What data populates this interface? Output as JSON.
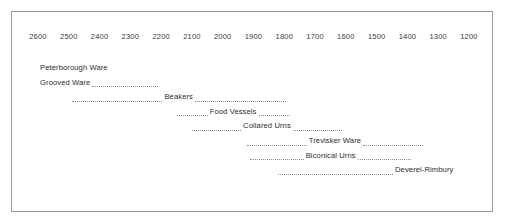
{
  "chart_data": {
    "type": "timeline",
    "title": "",
    "xlabel": "",
    "ylabel": "",
    "grid": false,
    "legend_position": "none",
    "x_axis": {
      "orientation": "horizontal-reversed",
      "unit": "BC",
      "min": 1200,
      "max": 2600,
      "step": 100,
      "tick_labels": [
        "2600",
        "2500",
        "2400",
        "2300",
        "2200",
        "2100",
        "2000",
        "1900",
        "1800",
        "1700",
        "1600",
        "1500",
        "1400",
        "1300",
        "1200"
      ]
    },
    "categories": [
      "Peterborough Ware",
      "Grooved Ware",
      "Beakers",
      "Food Vessels",
      "Collared Urns",
      "Trevisker Ware",
      "Biconical Urns",
      "Deverel-Rimbury"
    ],
    "series": [
      {
        "name": "Peterborough Ware",
        "label": "Peterborough Ware",
        "start": 2600,
        "end": 2480,
        "label_align": "left"
      },
      {
        "name": "Grooved Ware",
        "label": "Grooved Ware",
        "start": 2600,
        "end": 2210,
        "label_align": "left"
      },
      {
        "name": "Beakers",
        "label": "Beakers",
        "start": 2490,
        "end": 1790,
        "label_align": "center"
      },
      {
        "name": "Food Vessels",
        "label": "Food Vessels",
        "start": 2150,
        "end": 1770,
        "label_align": "center"
      },
      {
        "name": "Collared Urns",
        "label": "Collared Urns",
        "start": 2100,
        "end": 1590,
        "label_align": "center"
      },
      {
        "name": "Trevisker Ware",
        "label": "Trevisker Ware",
        "start": 1920,
        "end": 1330,
        "label_align": "center"
      },
      {
        "name": "Biconical Urns",
        "label": "Biconical Urns",
        "start": 1910,
        "end": 1360,
        "label_align": "center"
      },
      {
        "name": "Deverel-Rimbury",
        "label": "Deverel-Rimbury",
        "start": 1820,
        "end": 1230,
        "label_align": "right"
      }
    ]
  },
  "style": {
    "border_color": "#9a9a9a",
    "dot_color": "#8d8d8d",
    "label_color": "#2b2b2b",
    "axis_label_color": "#3a3a3a",
    "background": "#ffffff"
  }
}
